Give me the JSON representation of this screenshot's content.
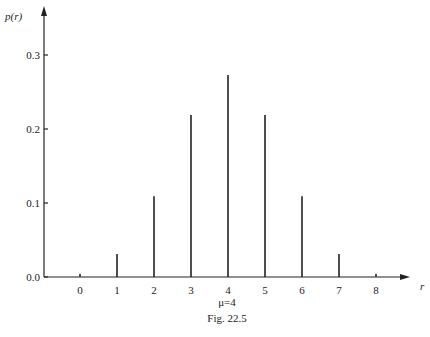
{
  "chart_data": {
    "type": "bar",
    "title": "",
    "xlabel": "r",
    "ylabel": "p(r)",
    "categories": [
      "0",
      "1",
      "2",
      "3",
      "4",
      "5",
      "6",
      "7",
      "8"
    ],
    "values": [
      0.004,
      0.031,
      0.109,
      0.219,
      0.273,
      0.219,
      0.109,
      0.031,
      0.004
    ],
    "yticks": [
      "0.0",
      "0.1",
      "0.2",
      "0.3"
    ],
    "ylim": [
      0,
      0.32
    ],
    "grid": false,
    "annotation": "μ=4",
    "caption": "Fig. 22.5"
  },
  "labels": {
    "ylabel": "p(r)",
    "xlabel": "r",
    "mu": "μ=4",
    "caption": "Fig. 22.5"
  }
}
